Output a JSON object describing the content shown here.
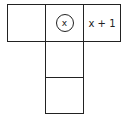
{
  "diagram": {
    "type": "cube net",
    "cells": [
      {
        "position": "top-left",
        "label": ""
      },
      {
        "position": "top-center",
        "label": "x",
        "circled": true
      },
      {
        "position": "top-right",
        "label": "x + 1"
      },
      {
        "position": "middle-center",
        "label": ""
      },
      {
        "position": "bottom-center",
        "label": ""
      }
    ]
  }
}
